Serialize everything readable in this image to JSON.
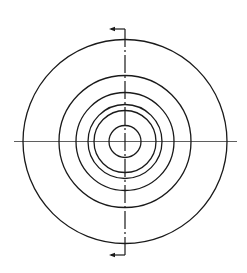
{
  "diagram": {
    "stroke_color": "#1a1a1a",
    "center": {
      "x": 125,
      "y": 141.5
    },
    "circles": [
      {
        "name": "outer-circle",
        "r": 102
      },
      {
        "name": "circle-2",
        "r": 66
      },
      {
        "name": "circle-3",
        "r": 49
      },
      {
        "name": "circle-4",
        "r": 37
      },
      {
        "name": "circle-5",
        "r": 31
      },
      {
        "name": "inner-circle",
        "r": 16
      }
    ],
    "horizontal_centerline": {
      "x1": 14,
      "x2": 237
    },
    "section_line": {
      "style": "dash-dot",
      "y1": 29,
      "y2": 255,
      "arrows": [
        {
          "position": "top",
          "direction": "left",
          "y": 29,
          "length": 14
        },
        {
          "position": "bottom",
          "direction": "left",
          "y": 255,
          "length": 14
        }
      ]
    }
  }
}
